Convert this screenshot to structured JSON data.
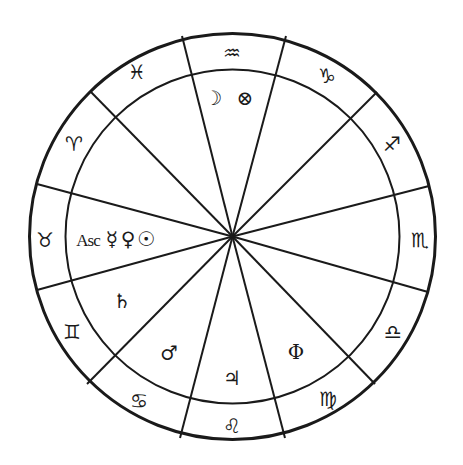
{
  "chart": {
    "type": "astrological-birth-chart",
    "colors": {
      "line": "#1a1a1a",
      "background": "#ffffff"
    },
    "center": [
      232.5,
      236.5
    ],
    "outer_radius": 203,
    "inner_radius": 167,
    "cusp_points": [
      [
        182,
        36
      ],
      [
        286,
        36
      ],
      [
        377,
        92
      ],
      [
        429,
        186
      ],
      [
        428,
        292
      ],
      [
        375,
        384
      ],
      [
        285,
        438
      ],
      [
        180,
        438
      ],
      [
        87,
        384
      ],
      [
        37,
        290
      ],
      [
        37,
        184
      ],
      [
        90,
        91
      ]
    ],
    "signs": [
      {
        "name": "Aquarius",
        "glyph": "♒",
        "x": 232,
        "y": 53
      },
      {
        "name": "Capricorn",
        "glyph": "♑",
        "x": 327,
        "y": 76
      },
      {
        "name": "Sagittarius",
        "glyph": "♐",
        "x": 392,
        "y": 144
      },
      {
        "name": "Scorpio",
        "glyph": "♏",
        "x": 420,
        "y": 240
      },
      {
        "name": "Libra",
        "glyph": "♎",
        "x": 393,
        "y": 332
      },
      {
        "name": "Virgo",
        "glyph": "♍",
        "x": 328,
        "y": 399
      },
      {
        "name": "Leo",
        "glyph": "♌",
        "x": 232,
        "y": 426
      },
      {
        "name": "Cancer",
        "glyph": "♋",
        "x": 139,
        "y": 401
      },
      {
        "name": "Gemini",
        "glyph": "♊",
        "x": 72,
        "y": 332
      },
      {
        "name": "Taurus",
        "glyph": "♉",
        "x": 45,
        "y": 240
      },
      {
        "name": "Aries",
        "glyph": "♈",
        "x": 74,
        "y": 144
      },
      {
        "name": "Pisces",
        "glyph": "♓",
        "x": 137,
        "y": 72
      }
    ],
    "houses": [
      {
        "house": "upper",
        "bodies": [
          {
            "name": "Moon",
            "glyph": "☽",
            "x": 213,
            "y": 98
          },
          {
            "name": "Part of Fortune",
            "glyph": "⊗",
            "x": 245,
            "y": 98
          }
        ]
      },
      {
        "house": "ascendant",
        "bodies": [
          {
            "name": "Ascendant",
            "glyph": "Asc",
            "x": 88,
            "y": 240,
            "is_text": true
          },
          {
            "name": "Mercury",
            "glyph": "☿",
            "x": 112,
            "y": 239
          },
          {
            "name": "Venus",
            "glyph": "♀",
            "x": 128,
            "y": 239
          },
          {
            "name": "Sun",
            "glyph": "☉",
            "x": 146,
            "y": 239
          }
        ]
      },
      {
        "house": "second",
        "bodies": [
          {
            "name": "Saturn",
            "glyph": "♄",
            "x": 122,
            "y": 301
          }
        ]
      },
      {
        "house": "third",
        "bodies": [
          {
            "name": "Mars",
            "glyph": "♂",
            "x": 169,
            "y": 353
          }
        ]
      },
      {
        "house": "fourth",
        "bodies": [
          {
            "name": "Jupiter",
            "glyph": "♃",
            "x": 232,
            "y": 378
          }
        ]
      },
      {
        "house": "fifth",
        "bodies": [
          {
            "name": "Phi",
            "glyph": "Φ",
            "x": 296,
            "y": 352
          }
        ]
      }
    ]
  }
}
